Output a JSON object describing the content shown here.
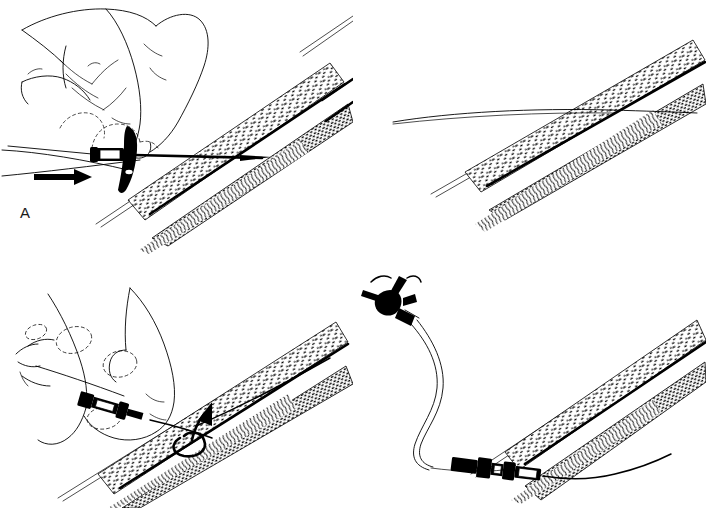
{
  "figure": {
    "kind": "medical-line-illustration",
    "background_color": "#ffffff",
    "ink_color": "#000000",
    "panel_count": 4
  },
  "panels": [
    {
      "id": "A",
      "label": "A",
      "caption_text": "A",
      "position": "top-left",
      "elements": [
        "hand-holding-needle",
        "winged-needle-hub",
        "introducer-needle",
        "skin-surface-line",
        "blood-vessel",
        "directional-arrow"
      ]
    },
    {
      "id": "B",
      "label": "B",
      "caption_text": "B",
      "position": "top-right",
      "elements": [
        "guidewire",
        "skin-surface-line",
        "blood-vessel"
      ]
    },
    {
      "id": "C",
      "label": "C",
      "caption_text": "C",
      "position": "bottom-left",
      "elements": [
        "hand-advancing-catheter",
        "catheter-hub",
        "guidewire",
        "rotation-arrow",
        "blood-vessel"
      ]
    },
    {
      "id": "D",
      "label": "D",
      "caption_text": "D",
      "position": "bottom-right",
      "elements": [
        "three-way-stopcock",
        "extension-tubing",
        "catheter-hub-connector",
        "indwelling-catheter",
        "blood-vessel"
      ]
    }
  ],
  "colors": {
    "ink": "#000000",
    "paper": "#ffffff",
    "label": "#1a1a1a"
  }
}
